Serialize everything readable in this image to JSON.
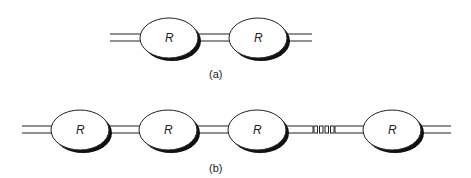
{
  "figure": {
    "a": {
      "caption": "(a)",
      "resonator_label": "R",
      "resonators": [
        169,
        258
      ],
      "wire_y": [
        34,
        41
      ],
      "cy": 38,
      "x_start": 110,
      "x_end": 312
    },
    "b": {
      "caption": "(b)",
      "resonator_label": "R",
      "resonators": [
        80,
        168,
        257,
        392
      ],
      "wire_y": [
        126,
        133
      ],
      "cy": 130,
      "x_start": 22,
      "x_end": 451,
      "ellipsis_segment": {
        "x_start": 313,
        "x_end": 335,
        "count": 4
      }
    },
    "colors": {
      "stroke": "#222222",
      "shadow": "#111111",
      "fill": "#ffffff"
    }
  }
}
